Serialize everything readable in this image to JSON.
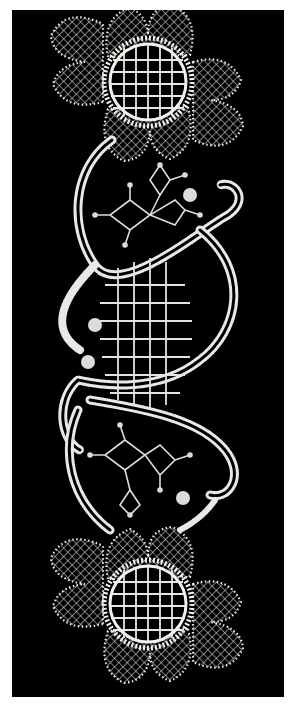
{
  "figure": {
    "background_color": "#000000",
    "page_color": "#ffffff",
    "lace_color": "#e8e8e4",
    "motifs": [
      {
        "name": "top-flower",
        "center_x": 148,
        "center_y": 82,
        "petals": 8,
        "grid": "5x5"
      },
      {
        "name": "upper-braid-loop"
      },
      {
        "name": "upper-star-motifs",
        "count": 2
      },
      {
        "name": "central-grid",
        "columns": 4,
        "rows": 7
      },
      {
        "name": "lower-star-motifs",
        "count": 2
      },
      {
        "name": "lower-braid-loop"
      },
      {
        "name": "bottom-flower",
        "center_x": 148,
        "center_y": 604,
        "petals": 8,
        "grid": "5x5"
      }
    ]
  }
}
